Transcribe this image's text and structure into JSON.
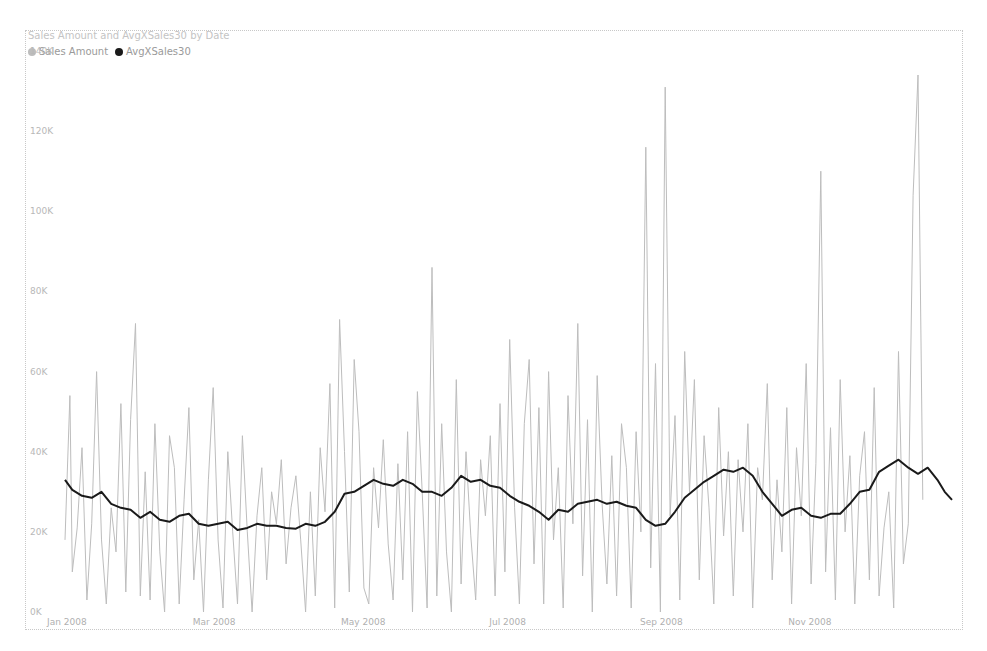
{
  "chart": {
    "title": "Sales Amount and AvgXSales30 by Date",
    "legend": [
      {
        "label": "Sales Amount",
        "color": "#bdbdbd"
      },
      {
        "label": "AvgXSales30",
        "color": "#1a1a1a"
      }
    ]
  },
  "chart_data": {
    "type": "line",
    "title": "Sales Amount and AvgXSales30 by Date",
    "xlabel": "",
    "ylabel": "",
    "ylim": [
      0,
      140000
    ],
    "yticks": [
      "0K",
      "20K",
      "40K",
      "60K",
      "80K",
      "100K",
      "120K",
      "140K"
    ],
    "xticks": [
      "Jan 2008",
      "Mar 2008",
      "May 2008",
      "Jul 2008",
      "Sep 2008",
      "Nov 2008"
    ],
    "grid": false,
    "legend_position": "top-left",
    "series": [
      {
        "name": "Sales Amount",
        "color": "#bdbdbd",
        "x_day_of_year": [
          1,
          3,
          4,
          6,
          8,
          10,
          12,
          14,
          16,
          18,
          20,
          22,
          24,
          26,
          28,
          30,
          32,
          34,
          36,
          38,
          40,
          42,
          44,
          46,
          48,
          50,
          52,
          54,
          56,
          58,
          60,
          62,
          64,
          66,
          68,
          70,
          72,
          74,
          76,
          78,
          80,
          82,
          84,
          86,
          88,
          90,
          92,
          94,
          96,
          98,
          100,
          102,
          104,
          106,
          108,
          110,
          112,
          114,
          116,
          118,
          120,
          122,
          124,
          126,
          128,
          130,
          132,
          134,
          136,
          138,
          140,
          142,
          144,
          146,
          148,
          150,
          152,
          154,
          156,
          158,
          160,
          162,
          164,
          166,
          168,
          170,
          172,
          174,
          176,
          178,
          180,
          182,
          184,
          186,
          188,
          190,
          192,
          194,
          196,
          198,
          200,
          202,
          204,
          206,
          208,
          210,
          212,
          214,
          216,
          218,
          220,
          222,
          224,
          226,
          228,
          230,
          232,
          234,
          236,
          238,
          240,
          242,
          244,
          246,
          248,
          250,
          252,
          254,
          256,
          258,
          260,
          262,
          264,
          266,
          268,
          270,
          272,
          274,
          276,
          278,
          280,
          282,
          284,
          286,
          288,
          290,
          292,
          294,
          296,
          298,
          300,
          302,
          304,
          306,
          308,
          310,
          312,
          314,
          316,
          318,
          320,
          322,
          324,
          326,
          328,
          330,
          332,
          334,
          336,
          338,
          340,
          342,
          344,
          346,
          348,
          350,
          352,
          354,
          356,
          358,
          360,
          362,
          364,
          366
        ],
        "values": [
          18000,
          54000,
          10000,
          21000,
          41000,
          3000,
          22000,
          60000,
          18000,
          2000,
          26000,
          15000,
          52000,
          5000,
          48000,
          72000,
          4000,
          35000,
          3000,
          47000,
          15000,
          0,
          44000,
          36000,
          2000,
          28000,
          51000,
          8000,
          23000,
          0,
          33000,
          56000,
          18000,
          1000,
          40000,
          20000,
          2000,
          44000,
          20000,
          0,
          24000,
          36000,
          8000,
          30000,
          22000,
          38000,
          12000,
          26000,
          34000,
          18000,
          0,
          30000,
          4000,
          41000,
          25000,
          57000,
          1000,
          73000,
          40000,
          5000,
          63000,
          45000,
          6000,
          2000,
          36000,
          21000,
          43000,
          17000,
          3000,
          37000,
          8000,
          45000,
          0,
          55000,
          30000,
          1000,
          86000,
          4000,
          47000,
          15000,
          0,
          58000,
          7000,
          40000,
          19000,
          3000,
          38000,
          24000,
          44000,
          4000,
          52000,
          10000,
          68000,
          26000,
          2000,
          47000,
          63000,
          12000,
          51000,
          2000,
          60000,
          18000,
          36000,
          1000,
          54000,
          22000,
          72000,
          9000,
          48000,
          0,
          59000,
          27000,
          7000,
          39000,
          4000,
          47000,
          36000,
          1000,
          45000,
          20000,
          116000,
          11000,
          62000,
          0,
          131000,
          24000,
          49000,
          3000,
          65000,
          30000,
          58000,
          8000,
          44000,
          26000,
          2000,
          51000,
          19000,
          40000,
          4000,
          38000,
          20000,
          47000,
          1000,
          36000,
          28000,
          57000,
          8000,
          33000,
          15000,
          51000,
          2000,
          41000,
          24000,
          62000,
          7000,
          37000,
          110000,
          10000,
          46000,
          3000,
          58000,
          20000,
          39000,
          2000,
          34000,
          45000,
          8000,
          56000,
          4000,
          21000,
          30000,
          1000,
          65000,
          12000,
          22000,
          104000,
          134000,
          28000
        ],
        "peaks": [
          {
            "approx_date": "Sep 2008",
            "value": 131000
          },
          {
            "approx_date": "late Aug 2008",
            "value": 116000
          },
          {
            "approx_date": "Dec 2008",
            "value": 134000
          },
          {
            "approx_date": "Nov 2008",
            "value": 110000
          },
          {
            "approx_date": "Jun 2008",
            "value": 86000
          }
        ]
      },
      {
        "name": "AvgXSales30",
        "color": "#1a1a1a",
        "x_day_of_year": [
          1,
          4,
          8,
          12,
          16,
          20,
          24,
          28,
          32,
          36,
          40,
          44,
          48,
          52,
          56,
          60,
          64,
          68,
          72,
          76,
          80,
          84,
          88,
          92,
          96,
          100,
          104,
          108,
          112,
          116,
          120,
          124,
          128,
          132,
          136,
          140,
          144,
          148,
          152,
          156,
          160,
          164,
          168,
          172,
          176,
          180,
          184,
          188,
          192,
          196,
          200,
          204,
          208,
          212,
          216,
          220,
          224,
          228,
          232,
          236,
          240,
          244,
          248,
          252,
          256,
          260,
          264,
          268,
          272,
          276,
          280,
          284,
          288,
          292,
          296,
          300,
          304,
          308,
          312,
          316,
          320,
          324,
          328,
          332,
          336,
          340,
          344,
          348,
          352,
          356,
          360,
          363,
          366
        ],
        "values": [
          33000,
          30500,
          29000,
          28500,
          30000,
          27000,
          26000,
          25500,
          23500,
          25000,
          23000,
          22500,
          24000,
          24500,
          22000,
          21500,
          22000,
          22500,
          20500,
          21000,
          22000,
          21500,
          21500,
          21000,
          20800,
          22000,
          21500,
          22500,
          25000,
          29500,
          30000,
          31500,
          33000,
          32000,
          31500,
          33000,
          32000,
          30000,
          30000,
          29000,
          31000,
          34000,
          32500,
          33000,
          31500,
          31000,
          29000,
          27500,
          26500,
          25000,
          23000,
          25500,
          25000,
          27000,
          27500,
          28000,
          27000,
          27500,
          26500,
          26000,
          23000,
          21500,
          22000,
          25000,
          28500,
          30500,
          32500,
          34000,
          35500,
          35000,
          36000,
          34000,
          30000,
          27000,
          24000,
          25500,
          26000,
          24000,
          23500,
          24500,
          24500,
          27000,
          30000,
          30500,
          35000,
          36500,
          38000,
          36000,
          34500,
          36000,
          33000,
          30000,
          28000,
          26000,
          29000
        ]
      }
    ]
  }
}
